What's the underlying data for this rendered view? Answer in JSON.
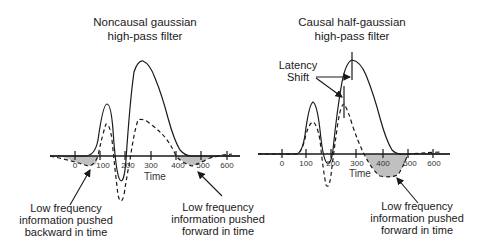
{
  "panels": [
    {
      "title_line1": "Noncausal gaussian",
      "title_line2": "high-pass filter",
      "x_axis_label": "Time",
      "ticks": [
        "0",
        "100",
        "200",
        "300",
        "400",
        "500",
        "600"
      ],
      "annotations": [
        {
          "lines": [
            "Low frequency",
            "information pushed",
            "backward in time"
          ]
        },
        {
          "lines": [
            "Low frequency",
            "information pushed",
            "forward in time"
          ]
        }
      ]
    },
    {
      "title_line1": "Causal half-gaussian",
      "title_line2": "high-pass filter",
      "x_axis_label": "Time",
      "ticks": [
        "0",
        "100",
        "200",
        "300",
        "400",
        "500",
        "600"
      ],
      "latency_label_line1": "Latency",
      "latency_label_line2": "Shift",
      "annotations": [
        {
          "lines": [
            "Low frequency",
            "information pushed",
            "forward in time"
          ]
        }
      ]
    }
  ],
  "legend": {
    "solid": "original waveform",
    "dashed": "filtered waveform"
  },
  "colors": {
    "line": "#1a1a1a",
    "shade": "#c0c0c0"
  }
}
